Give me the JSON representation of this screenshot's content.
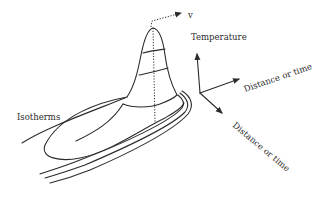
{
  "diagram": {
    "labels": {
      "velocity": "v",
      "temperature_axis": "Temperature",
      "axis_distance_1": "Distance or time",
      "axis_distance_2": "Distance or time",
      "isotherms": "Isotherms"
    },
    "colors": {
      "line": "#2b2b2b",
      "background": "#ffffff"
    }
  }
}
